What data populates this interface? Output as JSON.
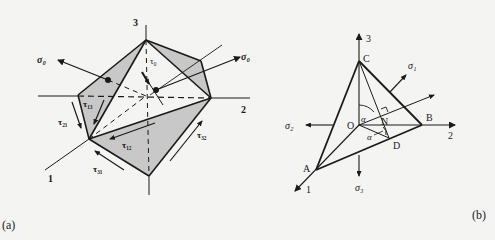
{
  "panel_a": {
    "caption": "(a)",
    "axes": {
      "axis1": "1",
      "axis2": "2",
      "axis3": "3"
    },
    "labels": {
      "sigma0_left": "σ₀",
      "sigma0_right": "σ₀",
      "tau0": "τ₀",
      "tau13": "τ₁₃",
      "tau21": "τ₂₁",
      "tau12": "τ₁₂",
      "tau31": "τ₃₁",
      "tau32": "τ₃₂"
    },
    "colors": {
      "shade": "#c8c8c8",
      "line": "#1a1a1a"
    }
  },
  "panel_b": {
    "caption": "(b)",
    "axes": {
      "axis1": "1",
      "axis2": "2",
      "axis3": "3"
    },
    "points": {
      "A": "A",
      "B": "B",
      "C": "C",
      "D": "D",
      "N": "N",
      "O": "O"
    },
    "labels": {
      "sigma1_top": "σ₁",
      "sigma2": "σ₂",
      "sigma3": "σ₃",
      "alpha_upper": "α",
      "alpha_lower": "α"
    }
  }
}
